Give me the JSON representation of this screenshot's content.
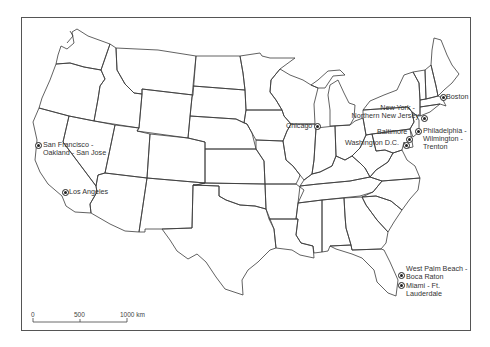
{
  "map": {
    "title": "",
    "region": "Contiguous United States",
    "style": {
      "line_color": "#3a3a3a",
      "marker_color": "#222222",
      "text_color": "#333333"
    }
  },
  "cities": [
    {
      "id": "san-francisco",
      "label_lines": [
        "San Francisco -",
        "Oakland - San Jose"
      ]
    },
    {
      "id": "los-angeles",
      "label_lines": [
        "Los Angeles"
      ]
    },
    {
      "id": "chicago",
      "label_lines": [
        "Chicago"
      ]
    },
    {
      "id": "boston",
      "label_lines": [
        "Boston"
      ]
    },
    {
      "id": "new-york",
      "label_lines": [
        "New York -",
        "Northern New Jersey"
      ]
    },
    {
      "id": "philadelphia",
      "label_lines": [
        "Philadelphia -",
        "Wilmington -",
        "Trenton"
      ]
    },
    {
      "id": "baltimore",
      "label_lines": [
        "Baltimore"
      ]
    },
    {
      "id": "washington",
      "label_lines": [
        "Washington D.C."
      ]
    },
    {
      "id": "west-palm-beach",
      "label_lines": [
        "West Palm Beach -",
        "Boca Raton"
      ]
    },
    {
      "id": "miami",
      "label_lines": [
        "Miami - Ft.",
        "Lauderdale"
      ]
    }
  ],
  "scale_bar": {
    "ticks": [
      "0",
      "500",
      "1000 km"
    ]
  }
}
